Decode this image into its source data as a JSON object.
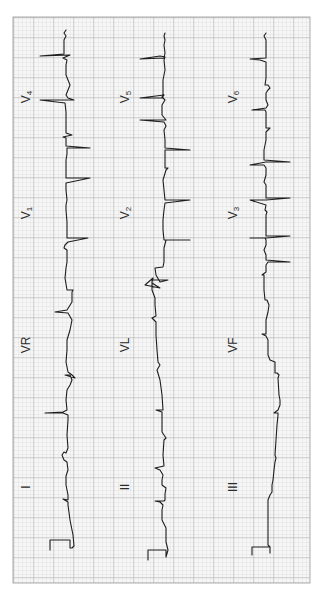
{
  "figure": {
    "type": "12-lead electrocardiogram strip (rotated 90°)",
    "paper": {
      "background": "#f7f7f7",
      "minor_grid_color": "#c9c9c9",
      "major_grid_color": "#9a9a9a",
      "area": {
        "x": 13,
        "y": 17,
        "width": 297,
        "height": 566
      },
      "minor_step": 4,
      "major_step": 20
    },
    "trace_color": "#1e1e1e"
  },
  "leads": [
    {
      "id": "I",
      "label": "I",
      "sub": "",
      "column": 0,
      "label_pos": [
        27,
        487
      ]
    },
    {
      "id": "VR",
      "label": "VR",
      "sub": "",
      "column": 0,
      "label_pos": [
        27,
        345
      ]
    },
    {
      "id": "V1",
      "label": "V",
      "sub": "1",
      "column": 0,
      "label_pos": [
        27,
        213
      ]
    },
    {
      "id": "V4",
      "label": "V",
      "sub": "4",
      "column": 0,
      "label_pos": [
        27,
        97
      ]
    },
    {
      "id": "II",
      "label": "II",
      "sub": "",
      "column": 1,
      "label_pos": [
        126,
        487
      ]
    },
    {
      "id": "VL",
      "label": "VL",
      "sub": "",
      "column": 1,
      "label_pos": [
        126,
        345
      ]
    },
    {
      "id": "V2",
      "label": "V",
      "sub": "2",
      "column": 1,
      "label_pos": [
        126,
        213
      ]
    },
    {
      "id": "V5",
      "label": "V",
      "sub": "5",
      "column": 1,
      "label_pos": [
        126,
        97
      ]
    },
    {
      "id": "III",
      "label": "III",
      "sub": "",
      "column": 2,
      "label_pos": [
        234,
        487
      ]
    },
    {
      "id": "VF",
      "label": "VF",
      "sub": "",
      "column": 2,
      "label_pos": [
        234,
        345
      ]
    },
    {
      "id": "V3",
      "label": "V",
      "sub": "3",
      "column": 2,
      "label_pos": [
        234,
        213
      ]
    },
    {
      "id": "V6",
      "label": "V",
      "sub": "6",
      "column": 2,
      "label_pos": [
        234,
        97
      ]
    }
  ],
  "traces": [
    {
      "column": 0,
      "points": "50,550 50,540 70,540 70,548 72,548 74,546 73,535 70,520 68,505 68,502 63,499 68,500 68,495 66,485 66,476 68,470 67,462 64,460 62,455 64,452 66,453 68,448 67,435 68,420 68,415 63,413 45,413 63,412 67,410 66,400 67,390 70,385 72,380 70,375 65,375 75,378 72,375 68,372 66,362 67,350 67,340 70,330 72,320 68,313 55,312 67,310 72,302 72,292 73,290 67,290 65,278 66,268 67,262 67,250 64,248 65,245 68,242 88,238 67,238 67,222 66,210 66,205 67,200 66,190 66,183 90,178 66,178 66,170 66,160 67,154 67,148 90,148 66,146 66,138 63,137 72,135 66,133 66,125 66,120 66,112 65,103 40,100 68,100 74,100 68,98 66,95 68,90 70,85 68,80 66,75 66,65 67,60 63,58 70,55 40,56 64,54 64,40 66,36 64,33 66,30"
    },
    {
      "column": 1,
      "points": "148,560 148,550 166,550 166,557 168,550 166,542 166,535 166,528 162,520 162,510 163,505 160,502 155,501 164,501 165,500 165,494 166,488 162,485 162,480 163,475 160,470 155,468 164,466 163,455 164,440 166,438 162,432 162,425 162,418 162,412 156,410 163,410 162,395 160,380 157,370 160,365 158,362 157,350 156,335 156,322 152,318 156,316 155,305 155,298 152,290 152,282 153,278 145,285 160,288 152,283 152,280 165,280 168,280 160,282 156,275 155,268 163,267 164,262 164,255 164,248 166,240 190,240 164,240 163,230 163,220 164,210 165,203 190,200 165,200 164,190 163,180 166,170 168,168 165,168 165,155 165,150 190,150 165,148 165,140 164,130 166,126 164,122 140,120 166,120 162,115 162,105 165,100 162,97 164,95 140,98 163,98 163,90 163,80 165,70 164,60 165,57 160,56 140,59 164,58 165,53 164,45 165,40 164,36 165,33"
    },
    {
      "column": 2,
      "points": "252,555 252,547 270,547 270,553 270,547 268,545 268,535 268,520 268,510 268,500 270,495 272,492 272,485 273,480 274,470 275,462 276,458 275,455 276,440 277,425 278,415 278,413 274,413 278,410 280,405 280,400 279,395 278,378 279,375 277,373 275,373 275,368 275,362 270,360 268,355 268,345 268,340 266,336 262,334 266,334 266,325 266,320 268,312 269,305 267,300 265,300 264,290 264,280 264,275 262,275 266,272 266,265 268,262 290,262 266,260 266,255 264,250 266,245 266,240 265,238 250,238 266,238 290,236 266,236 266,225 266,215 267,212 265,210 266,205 250,200 266,200 290,198 266,198 266,190 266,185 264,182 266,175 266,168 264,165 250,165 266,162 290,162 264,160 264,150 266,140 266,132 268,130 270,128 266,128 266,120 266,112 265,110 252,110 266,108 268,105 266,100 266,93 268,90 270,88 268,85 265,85 266,78 266,68 266,62 260,60 250,59 266,58 266,53 266,45 266,40 264,36 266,33"
    }
  ]
}
